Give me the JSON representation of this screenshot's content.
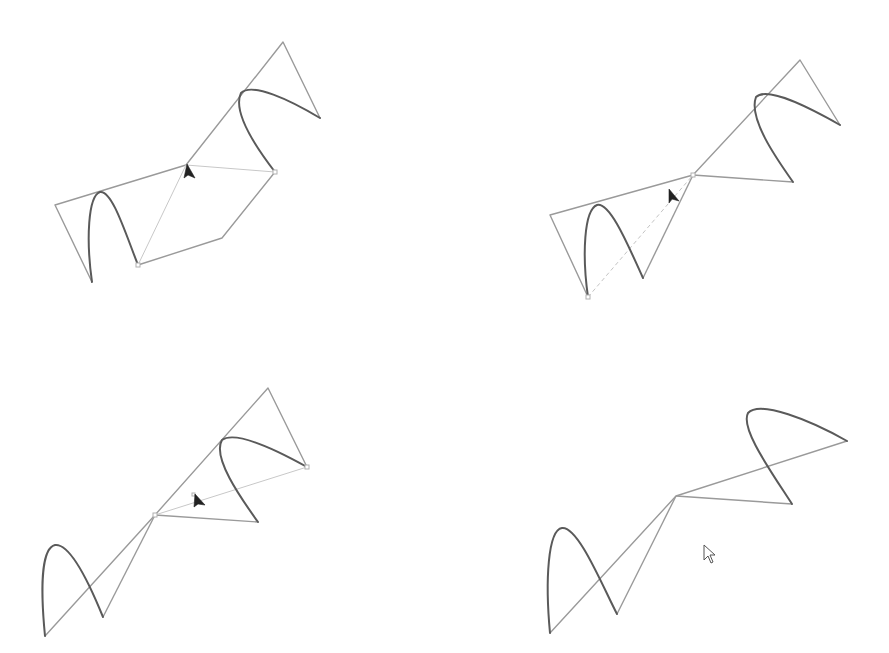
{
  "figure": {
    "colors": {
      "background": "#ffffff",
      "control_polygon": "#9a9a9a",
      "guide_line": "#c8c8c8",
      "curve": "#5a5a5a",
      "cursor": "#222222"
    },
    "panels": [
      {
        "id": "panel-1",
        "label": "",
        "cursor": {
          "type": "arrow-solid",
          "x": 186,
          "y": 165
        },
        "control_points": [
          [
            55,
            205
          ],
          [
            92,
            282
          ],
          [
            186,
            165
          ],
          [
            283,
            42
          ],
          [
            320,
            118
          ]
        ],
        "active_point": [
          186,
          165
        ],
        "guide_points": [
          [
            138,
            265
          ],
          [
            222,
            238
          ],
          [
            275,
            172
          ]
        ]
      },
      {
        "id": "panel-2",
        "label": "",
        "cursor": {
          "type": "arrow-solid",
          "x": 670,
          "y": 190
        },
        "control_points": [
          [
            550,
            215
          ],
          [
            588,
            297
          ],
          [
            693,
            175
          ],
          [
            800,
            60
          ],
          [
            840,
            125
          ]
        ],
        "active_point": [
          693,
          175
        ]
      },
      {
        "id": "panel-3",
        "label": "",
        "cursor": {
          "type": "arrow-solid",
          "x": 196,
          "y": 495
        },
        "control_points": [
          [
            45,
            636
          ],
          [
            155,
            515
          ],
          [
            268,
            388
          ],
          [
            307,
            467
          ]
        ],
        "active_point": [
          155,
          515
        ]
      },
      {
        "id": "panel-4",
        "label": "",
        "cursor": {
          "type": "arrow-hollow",
          "x": 704,
          "y": 546
        },
        "control_points": [
          [
            550,
            633
          ],
          [
            676,
            496
          ],
          [
            847,
            441
          ]
        ],
        "active_point": null
      }
    ]
  }
}
